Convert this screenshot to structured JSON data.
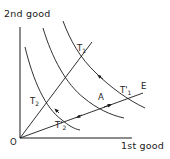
{
  "diagram": {
    "type": "indifference-curve-map",
    "axes": {
      "y_label": "2nd good",
      "x_label": "1st good",
      "origin_label": "O"
    },
    "rays": [
      {
        "name": "steep-ray",
        "from": "O",
        "through": [
          "T2",
          "T1"
        ]
      },
      {
        "name": "shallow-ray",
        "from": "O",
        "through": [
          "T'2",
          "A",
          "T'1"
        ],
        "end_label": "E"
      }
    ],
    "curves": [
      {
        "name": "inner-indifference-curve"
      },
      {
        "name": "middle-indifference-curve"
      },
      {
        "name": "outer-indifference-curve"
      }
    ],
    "points": {
      "T1": {
        "base": "T",
        "sub": "1",
        "prime": ""
      },
      "T2": {
        "base": "T",
        "sub": "2",
        "prime": ""
      },
      "T1p": {
        "base": "T",
        "sub": "1",
        "prime": "'"
      },
      "T2p": {
        "base": "T",
        "sub": "2",
        "prime": "'"
      },
      "A": {
        "base": "A"
      },
      "E": {
        "base": "E"
      }
    },
    "colors": {
      "ink": "#1a1a1a",
      "background": "#ffffff"
    }
  }
}
